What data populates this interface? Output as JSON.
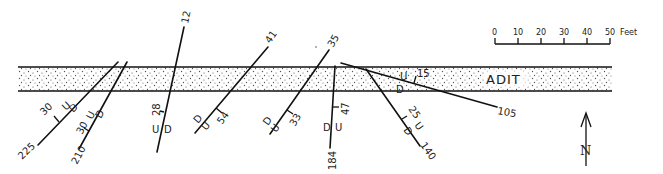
{
  "adit": {
    "label": "ADIT",
    "fill_color": "#f6f6f6",
    "dot_color": "#555555",
    "line_color": "#111111"
  },
  "scale_bar": {
    "ticks": [
      "0",
      "10",
      "20",
      "30",
      "40",
      "50"
    ],
    "unit": "Feet"
  },
  "north_arrow": {
    "label": "N"
  },
  "faults": [
    {
      "id": "f225",
      "strike_label": "225",
      "dip": "30",
      "up": "U",
      "down": "D"
    },
    {
      "id": "f210",
      "strike_label": "210",
      "dip": "30",
      "up": "U",
      "down": "D"
    },
    {
      "id": "f12",
      "strike_label": "12",
      "dip": "28",
      "up": "U",
      "down": "D"
    },
    {
      "id": "f41",
      "strike_label": "41",
      "dip": "54",
      "up": "U",
      "down": "D"
    },
    {
      "id": "f35",
      "strike_label": "35",
      "dip": "33",
      "up": "U",
      "down": "D"
    },
    {
      "id": "f184",
      "strike_label": "184",
      "dip": "47",
      "up": "U",
      "down": "D"
    },
    {
      "id": "f140",
      "strike_label": "140",
      "dip": "25",
      "up": "U",
      "down": "D"
    },
    {
      "id": "f105",
      "strike_label": "105",
      "dip": "15",
      "up": "U",
      "down": "D"
    }
  ]
}
